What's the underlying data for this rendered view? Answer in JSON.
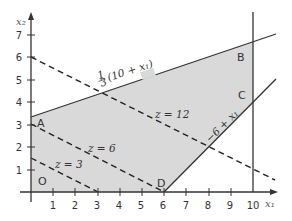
{
  "diagram": {
    "type": "linear-programming-feasible-region",
    "axes": {
      "x_label": "x₁",
      "y_label": "x₂",
      "x_ticks": [
        "1",
        "2",
        "3",
        "4",
        "5",
        "6",
        "7",
        "8",
        "9",
        "10"
      ],
      "y_ticks": [
        "1",
        "2",
        "3",
        "4",
        "5",
        "6",
        "7"
      ],
      "x_range": [
        0,
        11
      ],
      "y_range": [
        0,
        7.5
      ]
    },
    "feasible_region": {
      "fill": "#d9d9d9",
      "vertices": [
        {
          "label": "O",
          "x": 0,
          "y": 0
        },
        {
          "label": "A",
          "x": 0,
          "y": 3.333
        },
        {
          "label": "B",
          "x": 10,
          "y": 6.667
        },
        {
          "label": "C",
          "x": 10,
          "y": 4
        },
        {
          "label": "D",
          "x": 6,
          "y": 0
        }
      ]
    },
    "constraint_lines": [
      {
        "label": "1/3 (10 + x₁)",
        "label_num": "1",
        "label_den": "3",
        "label_rest": "(10 + x₁)"
      },
      {
        "label": "−6 + x₁"
      },
      {
        "label": "x₁ = 10"
      }
    ],
    "objective_lines": [
      {
        "label": "z = 3",
        "x_intercept": 3,
        "y_intercept": 1.5
      },
      {
        "label": "z = 6",
        "x_intercept": 6,
        "y_intercept": 3
      },
      {
        "label": "z = 12",
        "x_intercept": 12,
        "y_intercept": 6
      }
    ],
    "point_labels": {
      "O": "O",
      "A": "A",
      "B": "B",
      "C": "C",
      "D": "D"
    }
  }
}
